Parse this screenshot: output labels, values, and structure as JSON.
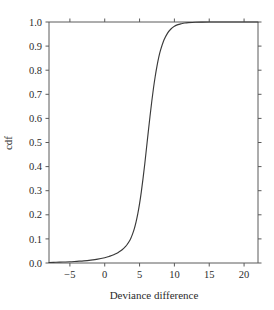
{
  "chart_data": {
    "type": "line",
    "title": "",
    "subtitle": "",
    "xlabel": "Deviance difference",
    "ylabel": "cdf",
    "xlim": [
      -8,
      22
    ],
    "ylim": [
      0.0,
      1.0
    ],
    "grid": false,
    "legend": null,
    "xticks": [
      -5,
      0,
      5,
      10,
      15,
      20
    ],
    "xtick_labels": [
      "−5",
      "0",
      "5",
      "10",
      "15",
      "20"
    ],
    "yticks": [
      0.0,
      0.1,
      0.2,
      0.3,
      0.4,
      0.5,
      0.6,
      0.7,
      0.8,
      0.9,
      1.0
    ],
    "ytick_labels": [
      "0.0",
      "0.1",
      "0.2",
      "0.3",
      "0.4",
      "0.5",
      "0.6",
      "0.7",
      "0.8",
      "0.9",
      "1.0"
    ],
    "series": [
      {
        "name": "cdf",
        "color": "#3a3a3a",
        "x": [
          -8.0,
          -7.0,
          -6.0,
          -5.0,
          -4.0,
          -3.0,
          -2.0,
          -1.0,
          0.0,
          0.5,
          1.0,
          1.5,
          2.0,
          2.5,
          3.0,
          3.25,
          3.5,
          3.75,
          4.0,
          4.25,
          4.5,
          4.75,
          5.0,
          5.25,
          5.5,
          5.75,
          6.0,
          6.25,
          6.5,
          6.75,
          7.0,
          7.25,
          7.5,
          7.75,
          8.0,
          8.5,
          9.0,
          9.5,
          10.0,
          10.5,
          11.0,
          11.5,
          12.0,
          13.0,
          14.0,
          15.0,
          16.0,
          17.0,
          18.0,
          19.0,
          20.0,
          21.0,
          22.0
        ],
        "y": [
          0.002,
          0.003,
          0.004,
          0.005,
          0.007,
          0.009,
          0.012,
          0.016,
          0.022,
          0.026,
          0.031,
          0.037,
          0.045,
          0.055,
          0.069,
          0.078,
          0.089,
          0.103,
          0.121,
          0.143,
          0.171,
          0.205,
          0.246,
          0.295,
          0.351,
          0.412,
          0.478,
          0.544,
          0.609,
          0.67,
          0.726,
          0.775,
          0.817,
          0.853,
          0.882,
          0.925,
          0.953,
          0.971,
          0.982,
          0.989,
          0.993,
          0.996,
          0.9975,
          0.9991,
          0.9996,
          0.9998,
          0.9999,
          0.99995,
          0.99997,
          0.99998,
          0.99999,
          0.99999,
          1.0
        ]
      }
    ],
    "annotations": []
  },
  "figure": {
    "background_color": "#ffffff",
    "axis_color": "#5a5a5a",
    "text_color": "#2b2b2b",
    "curve_color": "#3a3a3a"
  }
}
